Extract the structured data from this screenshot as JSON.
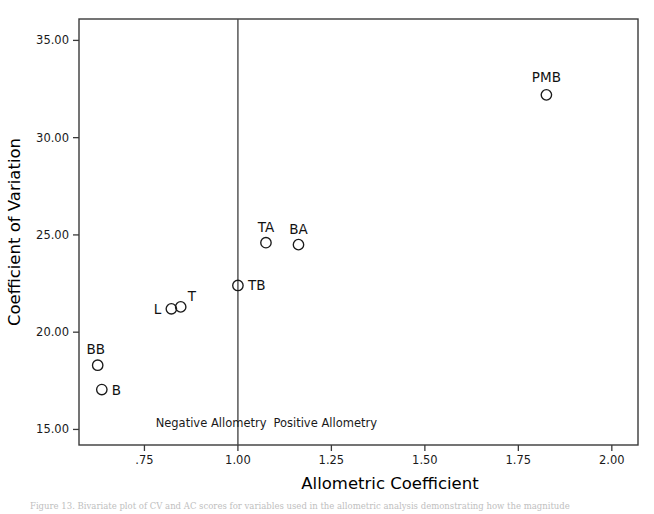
{
  "chart_data": {
    "type": "scatter",
    "title": "",
    "xlabel": "Allometric Coefficient",
    "ylabel": "Coefficient of Variation",
    "xlim": [
      0.575,
      2.07
    ],
    "ylim": [
      14.2,
      36.1
    ],
    "xticks": [
      ".75",
      "1.00",
      "1.25",
      "1.50",
      "1.75",
      "2.00"
    ],
    "xtick_values": [
      0.75,
      1.0,
      1.25,
      1.5,
      1.75,
      2.0
    ],
    "yticks": [
      "15.00",
      "20.00",
      "25.00",
      "30.00",
      "35.00"
    ],
    "ytick_values": [
      15,
      20,
      25,
      30,
      35
    ],
    "grid": false,
    "legend": "none",
    "reference_lines": [
      {
        "name": "isometry-line",
        "orientation": "vertical",
        "x": 1.0
      }
    ],
    "annotations": [
      {
        "name": "negative-allometry-label",
        "text": "Negative Allometry",
        "x": 0.78,
        "y": 15.15
      },
      {
        "name": "positive-allometry-label",
        "text": "Positive Allometry",
        "x": 1.095,
        "y": 15.15
      }
    ],
    "points": [
      {
        "label": "BB",
        "x": 0.625,
        "y": 18.3,
        "label_dx": -2,
        "label_dy": -11,
        "label_anchor": "middle"
      },
      {
        "label": "B",
        "x": 0.636,
        "y": 17.05,
        "label_dx": 10,
        "label_dy": 5,
        "label_anchor": "start"
      },
      {
        "label": "L",
        "x": 0.822,
        "y": 21.2,
        "label_dx": -10,
        "label_dy": 5,
        "label_anchor": "end"
      },
      {
        "label": "T",
        "x": 0.847,
        "y": 21.3,
        "label_dx": 7,
        "label_dy": -6,
        "label_anchor": "start"
      },
      {
        "label": "TB",
        "x": 1.0,
        "y": 22.4,
        "label_dx": 10,
        "label_dy": 5,
        "label_anchor": "start"
      },
      {
        "label": "TA",
        "x": 1.075,
        "y": 24.6,
        "label_dx": 0,
        "label_dy": -11,
        "label_anchor": "middle"
      },
      {
        "label": "BA",
        "x": 1.162,
        "y": 24.5,
        "label_dx": 0,
        "label_dy": -11,
        "label_anchor": "middle"
      },
      {
        "label": "PMB",
        "x": 1.825,
        "y": 32.2,
        "label_dx": 0,
        "label_dy": -13,
        "label_anchor": "middle"
      }
    ],
    "marker": {
      "shape": "circle",
      "radius": 5.2,
      "fill": "none",
      "stroke": "#1a1a1a"
    }
  },
  "caption": {
    "text": "Figure 13. Bivariate plot of CV and AC scores for variables used in the allometric analysis demonstrating how the magnitude"
  }
}
